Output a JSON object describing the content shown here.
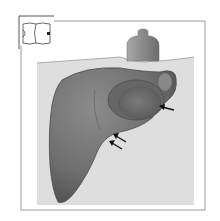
{
  "figure": {
    "title": "",
    "colors": {
      "background": "#ffffff",
      "panel_border": "#8a8a8a",
      "body_wall": "#dcdcdc",
      "liver_fill": "#7a7a7a",
      "liver_dark": "#555555",
      "gallbladder": "#6e6e6e",
      "transducer": "#8c8c8c",
      "arrow": "#111111"
    },
    "elements": {
      "orientation_icon": "body-orientation-icon",
      "transducer": "ultrasound-transducer",
      "organ": "liver",
      "structure": "gallbladder",
      "arrows": [
        {
          "name": "arrow-gallbladder",
          "direction": "left"
        },
        {
          "name": "arrow-lower-1",
          "direction": "up-left"
        },
        {
          "name": "arrow-lower-2",
          "direction": "up-left"
        }
      ]
    }
  }
}
